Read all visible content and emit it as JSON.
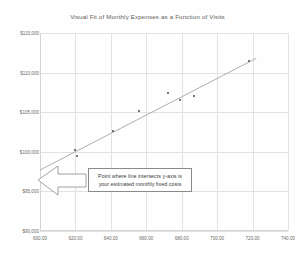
{
  "chart_data": {
    "type": "scatter",
    "title": "Visual Fit of Monthly Expenses as a Function of Visits",
    "xlabel": "",
    "ylabel": "",
    "grid": true,
    "legend": "none",
    "xlim": [
      600,
      740
    ],
    "ylim": [
      90000,
      115000
    ],
    "xticks": [
      "600.00",
      "620.00",
      "640.00",
      "660.00",
      "680.00",
      "700.00",
      "720.00",
      "740.00"
    ],
    "xtick_values": [
      600,
      620,
      640,
      660,
      680,
      700,
      720,
      740
    ],
    "yticks": [
      "$115,000",
      "$110,000",
      "$105,000",
      "$100,000",
      "$95,000",
      "$90,000"
    ],
    "ytick_values": [
      115000,
      110000,
      105000,
      100000,
      95000,
      90000
    ],
    "series": [
      {
        "name": "Monthly Expenses",
        "marker": "dot",
        "color": "#4a4a4a",
        "points": [
          {
            "x": 620,
            "y": 100200
          },
          {
            "x": 621,
            "y": 99500
          },
          {
            "x": 641,
            "y": 102600
          },
          {
            "x": 656,
            "y": 105100
          },
          {
            "x": 672,
            "y": 107400
          },
          {
            "x": 679,
            "y": 106500
          },
          {
            "x": 687,
            "y": 107000
          },
          {
            "x": 718,
            "y": 111500
          }
        ]
      }
    ],
    "fit_line": {
      "name": "Visual fit line",
      "color": "#9a9a9a",
      "x_start": 600,
      "y_start": 97700,
      "x_end": 722,
      "y_end": 111800
    },
    "annotations": [
      {
        "name": "fixed-costs-callout",
        "lines": [
          "Point where line intersects y-axis is",
          "your estimated monthly fixed costs"
        ],
        "arrow": "left-block-arrow",
        "arrow_target_x": 600,
        "arrow_target_y": 97700
      }
    ]
  },
  "colors": {
    "grid": "#e2e2e2",
    "axis": "#d4d4d4",
    "marker": "#4a4a4a",
    "fit_line": "#9a9a9a",
    "text": "#6a6a6a",
    "title_text": "#5d5d5d",
    "annotation_border": "#8a8a8a",
    "annotation_text": "#3c3c3c",
    "background": "#fefefe"
  }
}
